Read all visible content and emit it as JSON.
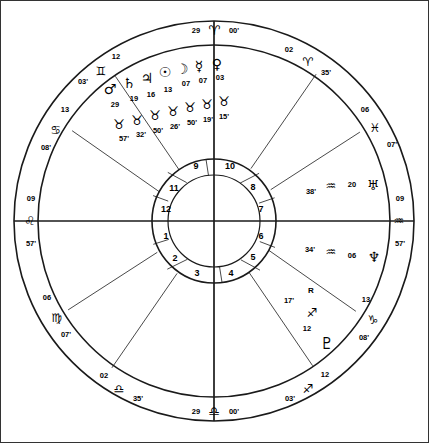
{
  "chart": {
    "type": "astrological-wheel",
    "size": {
      "width": 429,
      "height": 443
    },
    "center": {
      "x": 214,
      "y": 221
    },
    "radii": {
      "outer_ring_outer": 200,
      "outer_ring_inner": 176,
      "house_ring_outer": 62,
      "house_ring_inner": 46
    }
  },
  "axis_labels": {
    "mc": {
      "degree": "29",
      "sign_glyph": "♈",
      "sign_name": "Aries",
      "minute": "00'",
      "position": "top"
    },
    "ic": {
      "degree": "29",
      "sign_glyph": "♎",
      "sign_name": "Libra",
      "minute": "00'",
      "position": "bottom"
    },
    "asc": {
      "degree": "09",
      "sign_glyph": "♌",
      "sign_name": "Leo",
      "minute": "57'",
      "position": "left"
    },
    "dsc": {
      "degree": "09",
      "sign_glyph": "♒",
      "sign_name": "Aquarius",
      "minute": "57'",
      "position": "right"
    }
  },
  "house_cusps": [
    {
      "house": 11,
      "degree": "12",
      "sign_glyph": "♊",
      "sign_name": "Gemini",
      "minute": "03'"
    },
    {
      "house": 12,
      "degree": "13",
      "sign_glyph": "♋",
      "sign_name": "Cancer",
      "minute": "08'"
    },
    {
      "house": 1,
      "degree": "09",
      "sign_glyph": "♌",
      "sign_name": "Leo",
      "minute": "57'"
    },
    {
      "house": 2,
      "degree": "06",
      "sign_glyph": "♍",
      "sign_name": "Virgo",
      "minute": "07'"
    },
    {
      "house": 3,
      "degree": "02",
      "sign_glyph": "♎",
      "sign_name": "Libra",
      "minute": "35'"
    },
    {
      "house": 4,
      "degree": "29",
      "sign_glyph": "♎",
      "sign_name": "Libra",
      "minute": "00'"
    },
    {
      "house": 5,
      "degree": "12",
      "sign_glyph": "♐",
      "sign_name": "Sagittarius",
      "minute": "03'"
    },
    {
      "house": 6,
      "degree": "13",
      "sign_glyph": "♑",
      "sign_name": "Capricorn",
      "minute": "08'"
    },
    {
      "house": 7,
      "degree": "09",
      "sign_glyph": "♒",
      "sign_name": "Aquarius",
      "minute": "57'"
    },
    {
      "house": 8,
      "degree": "06",
      "sign_glyph": "♓",
      "sign_name": "Pisces",
      "minute": "07'"
    },
    {
      "house": 9,
      "degree": "02",
      "sign_glyph": "♈",
      "sign_name": "Aries",
      "minute": "35'"
    },
    {
      "house": 10,
      "degree": "29",
      "sign_glyph": "♈",
      "sign_name": "Aries",
      "minute": "00'"
    }
  ],
  "house_numbers": [
    "1",
    "2",
    "3",
    "4",
    "5",
    "6",
    "7",
    "8",
    "9",
    "10",
    "11",
    "12"
  ],
  "planets_cluster_top": [
    {
      "name": "Mars",
      "glyph": "♂",
      "degree": "29"
    },
    {
      "name": "Saturn",
      "glyph": "♄",
      "degree": "19"
    },
    {
      "name": "Jupiter",
      "glyph": "♃",
      "degree": "16"
    },
    {
      "name": "Sun",
      "glyph": "☉",
      "degree": "13"
    },
    {
      "name": "Moon",
      "glyph": "☽",
      "degree": "07"
    },
    {
      "name": "Mercury",
      "glyph": "☿",
      "degree": "07"
    },
    {
      "name": "Venus",
      "glyph": "♀",
      "degree": "03"
    }
  ],
  "planets_cluster_bottom_signs": [
    {
      "sign_glyph": "♉",
      "sign_name": "Taurus",
      "minute": "57'"
    },
    {
      "sign_glyph": "♉",
      "sign_name": "Taurus",
      "minute": "32'"
    },
    {
      "sign_glyph": "♉",
      "sign_name": "Taurus",
      "minute": "50'"
    },
    {
      "sign_glyph": "♉",
      "sign_name": "Taurus",
      "minute": "26'"
    },
    {
      "sign_glyph": "♉",
      "sign_name": "Taurus",
      "minute": "50'"
    },
    {
      "sign_glyph": "♉",
      "sign_name": "Taurus",
      "minute": "19'"
    },
    {
      "sign_glyph": "♉",
      "sign_name": "Taurus",
      "minute": "15'"
    }
  ],
  "planets_right": [
    {
      "name": "Uranus",
      "glyph": "♅",
      "degree": "20",
      "sign_glyph": "♒",
      "sign_name": "Aquarius",
      "minute": "38'",
      "retrograde": false
    },
    {
      "name": "Neptune",
      "glyph": "♆",
      "degree": "06",
      "sign_glyph": "♒",
      "sign_name": "Aquarius",
      "minute": "34'",
      "retrograde": false
    },
    {
      "name": "Pluto",
      "glyph": "♇",
      "degree": "12",
      "sign_glyph": "♐",
      "sign_name": "Sagittarius",
      "minute": "17'",
      "retrograde": true,
      "retrograde_mark": "R"
    }
  ]
}
